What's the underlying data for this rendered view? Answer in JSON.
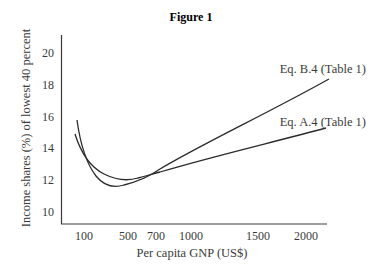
{
  "chart_data": {
    "type": "line",
    "title": "Figure 1",
    "xlabel": "Per capita GNP (US$)",
    "ylabel": "Income shares (%) of lowest 40 percent",
    "x_ticks": [
      {
        "label": "100",
        "px": 84
      },
      {
        "label": "500",
        "px": 128
      },
      {
        "label": "700",
        "px": 156
      },
      {
        "label": "1000",
        "px": 191
      },
      {
        "label": "1500",
        "px": 258
      },
      {
        "label": "2000",
        "px": 306
      }
    ],
    "y_ticks": [
      "10",
      "12",
      "14",
      "16",
      "18",
      "20"
    ],
    "ylim": [
      9.3,
      21
    ],
    "grid": false,
    "legend_position": "inline labels at right end of lines",
    "series": [
      {
        "name": "Eq. B.4 (Table 1)",
        "x": [
          80,
          100,
          150,
          200,
          300,
          400,
          500,
          600,
          700,
          1000,
          1500,
          2000,
          2200
        ],
        "values": [
          15.6,
          14.6,
          13.2,
          12.4,
          11.7,
          11.6,
          11.8,
          12.1,
          12.5,
          13.7,
          16.0,
          17.9,
          18.4
        ]
      },
      {
        "name": "Eq. A.4 (Table 1)",
        "x": [
          75,
          100,
          150,
          200,
          300,
          400,
          500,
          600,
          700,
          1000,
          1500,
          2000,
          2150
        ],
        "values": [
          14.9,
          14.2,
          13.3,
          12.8,
          12.3,
          12.1,
          12.1,
          12.3,
          12.5,
          13.0,
          14.0,
          14.9,
          15.2
        ]
      }
    ]
  }
}
